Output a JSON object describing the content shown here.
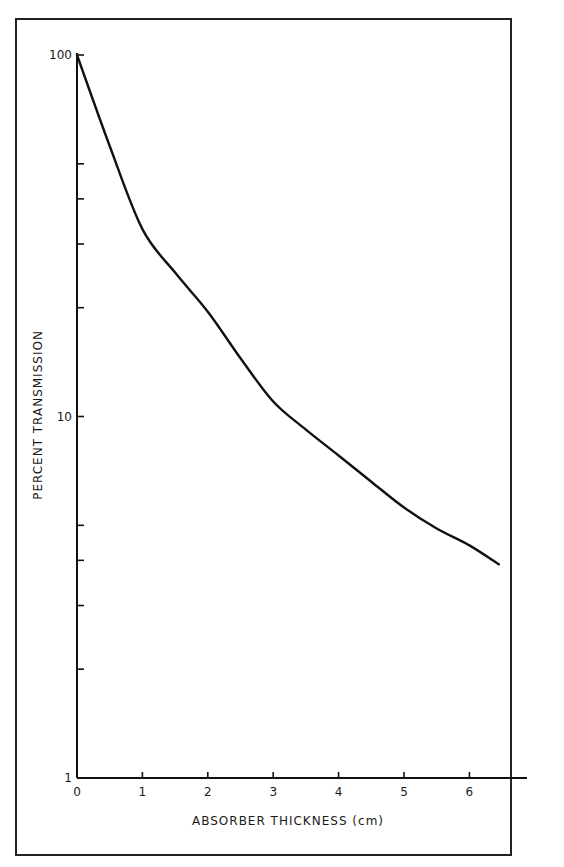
{
  "chart_data": {
    "type": "line",
    "title": "",
    "xlabel": "ABSORBER THICKNESS (cm)",
    "ylabel": "PERCENT TRANSMISSION",
    "yscale": "log",
    "xlim": [
      0,
      6.5
    ],
    "ylim": [
      1,
      100
    ],
    "x_ticks": [
      0,
      1,
      2,
      3,
      4,
      5,
      6
    ],
    "x_tick_labels": [
      "0",
      "1",
      "2",
      "3",
      "4",
      "5",
      "6"
    ],
    "y_major_ticks": [
      1,
      10,
      100
    ],
    "y_tick_labels": [
      "1",
      "10",
      "100"
    ],
    "y_minor_ticks": [
      2,
      3,
      4,
      5,
      20,
      30,
      40,
      50
    ],
    "grid": false,
    "legend": null,
    "series": [
      {
        "name": "transmission",
        "x": [
          0,
          0.5,
          1,
          1.5,
          2,
          2.5,
          3,
          3.5,
          4,
          4.5,
          5,
          5.5,
          6,
          6.45
        ],
        "values": [
          100,
          56,
          33,
          25,
          19.5,
          14.5,
          11,
          9.2,
          7.8,
          6.6,
          5.6,
          4.9,
          4.4,
          3.9
        ]
      }
    ]
  }
}
